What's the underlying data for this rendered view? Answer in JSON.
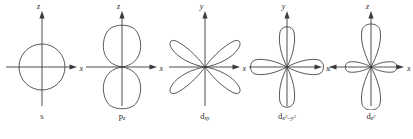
{
  "figure": {
    "background_color": "#ffffff",
    "line_color": "#3a3a3a",
    "text_color": "#2b2b2b"
  },
  "orbitals": [
    {
      "id": "s",
      "shape": "circle",
      "label_base": "s",
      "label_sub": "",
      "label_sup": "",
      "vertical_axis_label": "z",
      "horizontal_axis_label": "x",
      "lobe_count": 0,
      "lobe_orientation": "spherical"
    },
    {
      "id": "pz",
      "shape": "two-lobe",
      "label_base": "p",
      "label_sub": "z",
      "label_sup": "",
      "vertical_axis_label": "z",
      "horizontal_axis_label": "x",
      "lobe_count": 2,
      "lobe_orientation": "vertical"
    },
    {
      "id": "dxy",
      "shape": "four-lobe",
      "label_base": "d",
      "label_sub": "xy",
      "label_sup": "",
      "vertical_axis_label": "y",
      "horizontal_axis_label": "x",
      "lobe_count": 4,
      "lobe_orientation": "diagonal"
    },
    {
      "id": "dx2y2",
      "shape": "four-lobe",
      "label_base": "d",
      "label_sub": "x",
      "label_sub_tail": "–y",
      "label_sup": "2",
      "vertical_axis_label": "y",
      "horizontal_axis_label": "x",
      "lobe_count": 4,
      "lobe_orientation": "axial"
    },
    {
      "id": "dz2",
      "shape": "two-lobe-with-torus",
      "label_base": "d",
      "label_sub": "z",
      "label_sup": "2",
      "vertical_axis_label": "z",
      "horizontal_axis_label": "x",
      "lobe_count": 2,
      "lobe_orientation": "vertical-with-ring"
    }
  ]
}
